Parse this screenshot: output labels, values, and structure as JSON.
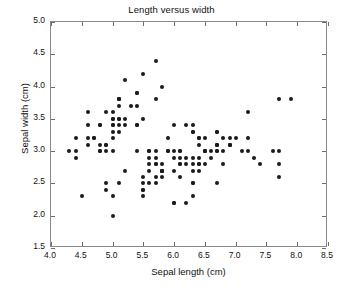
{
  "chart_data": {
    "type": "scatter",
    "title": "Length versus width",
    "xlabel": "Sepal length (cm)",
    "ylabel": "Sepal width (cm)",
    "xlim": [
      4.0,
      8.5
    ],
    "ylim": [
      1.5,
      5.0
    ],
    "xticks": [
      4.0,
      4.5,
      5.0,
      5.5,
      6.0,
      6.5,
      7.0,
      7.5,
      8.0,
      8.5
    ],
    "yticks": [
      1.5,
      2.0,
      2.5,
      3.0,
      3.5,
      4.0,
      4.5,
      5.0
    ],
    "xticklabels": [
      "4.0",
      "4.5",
      "5.0",
      "5.5",
      "6.0",
      "6.5",
      "7.0",
      "7.5",
      "8.0",
      "8.5"
    ],
    "yticklabels": [
      "1.5",
      "2.0",
      "2.5",
      "3.0",
      "3.5",
      "4.0",
      "4.5",
      "5.0"
    ],
    "grid": false,
    "legend": null,
    "marker": "circle",
    "marker_color": "#1b1b1b",
    "marker_size_px": 4,
    "axes_color": "#8a8a8a",
    "background_color": "#ffffff",
    "n_points": 150,
    "series": [
      {
        "name": "sepal",
        "x": [
          5.1,
          4.9,
          4.7,
          4.6,
          5.0,
          5.4,
          4.6,
          5.0,
          4.4,
          4.9,
          5.4,
          4.8,
          4.8,
          4.3,
          5.8,
          5.7,
          5.4,
          5.1,
          5.7,
          5.1,
          5.4,
          5.1,
          4.6,
          5.1,
          4.8,
          5.0,
          5.0,
          5.2,
          5.2,
          4.7,
          4.8,
          5.4,
          5.2,
          5.5,
          4.9,
          5.0,
          5.5,
          4.9,
          4.4,
          5.1,
          5.0,
          4.5,
          4.4,
          5.0,
          5.1,
          4.8,
          5.1,
          4.6,
          5.3,
          5.0,
          7.0,
          6.4,
          6.9,
          5.5,
          6.5,
          5.7,
          6.3,
          4.9,
          6.6,
          5.2,
          5.0,
          5.9,
          6.0,
          6.1,
          5.6,
          6.7,
          5.6,
          5.8,
          6.2,
          5.6,
          5.9,
          6.1,
          6.3,
          6.1,
          6.4,
          6.6,
          6.8,
          6.7,
          6.0,
          5.7,
          5.5,
          5.5,
          5.8,
          6.0,
          5.4,
          6.0,
          6.7,
          6.3,
          5.6,
          5.5,
          5.5,
          6.1,
          5.8,
          5.0,
          5.6,
          5.7,
          5.7,
          6.2,
          5.1,
          5.7,
          6.3,
          5.8,
          7.1,
          6.3,
          6.5,
          7.6,
          4.9,
          7.3,
          6.7,
          7.2,
          6.5,
          6.4,
          6.8,
          5.7,
          5.8,
          6.4,
          6.5,
          7.7,
          7.7,
          6.0,
          6.9,
          5.6,
          7.7,
          6.3,
          6.7,
          7.2,
          6.2,
          6.1,
          6.4,
          7.2,
          7.4,
          7.9,
          6.4,
          6.3,
          6.1,
          7.7,
          6.3,
          6.4,
          6.0,
          6.9,
          6.7,
          6.9,
          5.8,
          6.8,
          6.7,
          6.7,
          6.3,
          6.5,
          6.2,
          5.9
        ],
        "y": [
          3.5,
          3.0,
          3.2,
          3.1,
          3.6,
          3.9,
          3.4,
          3.4,
          2.9,
          3.1,
          3.7,
          3.4,
          3.0,
          3.0,
          4.0,
          4.4,
          3.9,
          3.5,
          3.8,
          3.8,
          3.4,
          3.7,
          3.6,
          3.3,
          3.4,
          3.0,
          3.4,
          3.5,
          3.4,
          3.2,
          3.1,
          3.4,
          4.1,
          4.2,
          3.1,
          3.2,
          3.5,
          3.6,
          3.0,
          3.4,
          3.5,
          2.3,
          3.2,
          3.5,
          3.8,
          3.0,
          3.8,
          3.2,
          3.7,
          3.3,
          3.2,
          3.2,
          3.1,
          2.3,
          2.8,
          2.8,
          3.3,
          2.4,
          2.9,
          2.7,
          2.0,
          3.0,
          2.2,
          2.9,
          2.9,
          3.1,
          3.0,
          2.7,
          2.2,
          2.5,
          3.2,
          2.8,
          2.5,
          2.8,
          2.9,
          3.0,
          2.8,
          3.0,
          2.9,
          2.6,
          2.4,
          2.4,
          2.7,
          2.7,
          3.0,
          3.4,
          3.1,
          2.3,
          3.0,
          2.5,
          2.6,
          3.0,
          2.6,
          2.3,
          2.7,
          3.0,
          2.9,
          2.9,
          2.5,
          2.8,
          3.3,
          2.7,
          3.0,
          2.9,
          3.0,
          3.0,
          2.5,
          2.9,
          2.5,
          3.6,
          3.2,
          2.7,
          3.0,
          2.5,
          2.8,
          3.2,
          3.0,
          3.8,
          2.6,
          2.2,
          3.2,
          2.8,
          2.8,
          2.7,
          3.3,
          3.2,
          2.8,
          3.0,
          2.8,
          3.0,
          2.8,
          3.8,
          2.8,
          2.8,
          2.6,
          3.0,
          3.4,
          3.1,
          3.0,
          3.1,
          3.1,
          3.1,
          2.7,
          3.2,
          3.3,
          3.0,
          2.5,
          3.0,
          3.4,
          3.0
        ]
      }
    ]
  }
}
